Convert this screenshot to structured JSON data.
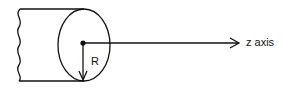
{
  "diagram": {
    "axis_label": "z axis",
    "radius_label": "R",
    "stroke_color": "#111111"
  }
}
